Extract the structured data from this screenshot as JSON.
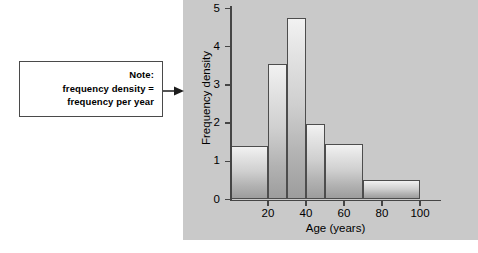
{
  "note": {
    "lines": [
      "Note:",
      "frequency density =",
      "frequency per year"
    ]
  },
  "arrow": {
    "icon": "arrow-right-icon"
  },
  "chart_data": {
    "type": "bar",
    "subtype": "histogram",
    "title": "",
    "xlabel": "Age (years)",
    "ylabel": "Frequency density",
    "xlim": [
      0,
      110
    ],
    "ylim": [
      0,
      5
    ],
    "grid": false,
    "legend": false,
    "x_ticks": [
      20,
      40,
      60,
      80,
      100
    ],
    "x_tick_labels": [
      "20",
      "40",
      "60",
      "80",
      "100"
    ],
    "y_ticks": [
      0,
      1,
      2,
      3,
      4,
      5
    ],
    "y_tick_labels": [
      "0",
      "1",
      "2",
      "3",
      "4",
      "5"
    ],
    "bins": [
      {
        "start": 0,
        "end": 20,
        "value": 1.4
      },
      {
        "start": 20,
        "end": 30,
        "value": 3.55
      },
      {
        "start": 30,
        "end": 40,
        "value": 4.75
      },
      {
        "start": 40,
        "end": 50,
        "value": 1.98
      },
      {
        "start": 50,
        "end": 70,
        "value": 1.45
      },
      {
        "start": 70,
        "end": 100,
        "value": 0.5
      }
    ]
  },
  "colors": {
    "panel_background": "#c9c9c9",
    "page_background": "#ffffff",
    "axis": "#454545",
    "bar_outline": "#4d4d4d",
    "bar_fill_light": "#f2f2f2",
    "bar_fill_dark": "#9d9d9d",
    "note_border": "#4a4a4a",
    "text": "#000000"
  }
}
